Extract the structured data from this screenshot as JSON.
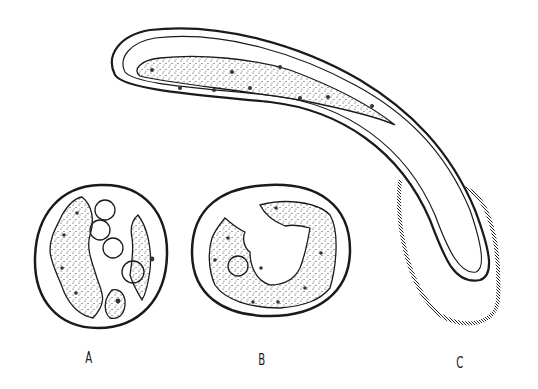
{
  "figure": {
    "panels": [
      {
        "id": "A",
        "label": "A",
        "description": "cross-section with stippled cells and four round cysts"
      },
      {
        "id": "B",
        "label": "B",
        "description": "cross-section with stippled ring of cells"
      },
      {
        "id": "C",
        "label": "C",
        "description": "elongated curved tube with cellular contents and banded sheath"
      }
    ],
    "colors": {
      "ink": "#1a1a1a",
      "paper": "#ffffff"
    }
  }
}
